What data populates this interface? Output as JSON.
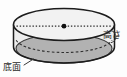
{
  "figure": {
    "kind": "cylinder-diagram",
    "background_color": "#fdfdfd",
    "outline_color": "#1c1c1c",
    "top_face_fill": "#f2f2f2",
    "side_wall_fill": "#ededed",
    "base_face_fill": "#b2b2b2",
    "base_face_edge": "#3a3a3a",
    "dotted_line_color": "#2b2b2b",
    "center_dot_color": "#111111",
    "labels": {
      "base": {
        "text": "底面",
        "meaning": "base-face",
        "leader": "short diagonal line pointing up-right to shaded base ellipse"
      },
      "height": {
        "text": "高さ",
        "meaning": "height",
        "leader": "small bracket on the right side spanning the cylinder wall"
      }
    },
    "features": {
      "top_ellipse": "solid outline, light fill",
      "hidden_rear_ellipse": "dashed arc (hidden edge)",
      "diameter_line": "horizontal dotted line across top face",
      "center_point": "filled dot at center of top face"
    }
  }
}
